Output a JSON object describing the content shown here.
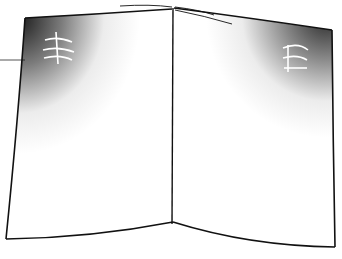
{
  "illustration": {
    "subject": "open-book",
    "style": "pen-and-ink stipple drawing",
    "ink_color": "#111111",
    "paper_color": "#ffffff",
    "left_page": {
      "shading": "dense stipple top-left corner fading downward and right",
      "glyph_marks": "illegible scribbled text lines"
    },
    "right_page": {
      "shading": "dense stipple top-right corner fading downward and left",
      "glyph_marks": "illegible scribbled text lines"
    },
    "leader_line": {
      "present": true
    }
  }
}
